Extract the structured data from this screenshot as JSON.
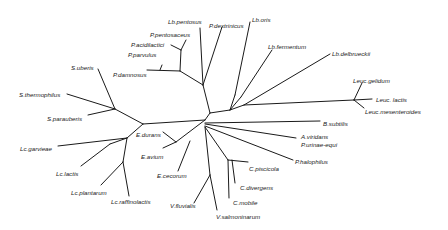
{
  "diagram": {
    "type": "unrooted phylogenetic tree",
    "taxa": [
      {
        "id": "lb_pentosus",
        "label": "Lb.pentosus",
        "x": 168,
        "y": 19
      },
      {
        "id": "p_dextrinicus",
        "label": "P.dextrinicus",
        "x": 209,
        "y": 23
      },
      {
        "id": "lb_oris",
        "label": "Lb.oris",
        "x": 252,
        "y": 17
      },
      {
        "id": "p_pentosaceus",
        "label": "P.pentosaceus",
        "x": 150,
        "y": 32
      },
      {
        "id": "p_acidilactici",
        "label": "P.acidilactici",
        "x": 131,
        "y": 42
      },
      {
        "id": "p_parvulus",
        "label": "P.parvulus",
        "x": 128,
        "y": 52
      },
      {
        "id": "p_damnosus",
        "label": "P.damnosus",
        "x": 113,
        "y": 72
      },
      {
        "id": "lb_fermentum",
        "label": "Lb.fermentum",
        "x": 268,
        "y": 44
      },
      {
        "id": "lb_delbrueckii",
        "label": "Lb.delbrueckii",
        "x": 332,
        "y": 51
      },
      {
        "id": "s_uberis",
        "label": "S.uberis",
        "x": 71,
        "y": 65
      },
      {
        "id": "s_thermophilus",
        "label": "S.thermophilus",
        "x": 19,
        "y": 92
      },
      {
        "id": "s_parauberis",
        "label": "S.parauberis",
        "x": 47,
        "y": 116
      },
      {
        "id": "leuc_gelidum",
        "label": "Leuc.gelidum",
        "x": 353,
        "y": 78
      },
      {
        "id": "leuc_lactis",
        "label": "Leuc. lactis",
        "x": 376,
        "y": 97
      },
      {
        "id": "leuc_mesenteroides",
        "label": "Leuc.mesenteroides",
        "x": 365,
        "y": 109
      },
      {
        "id": "b_subtilis",
        "label": "B.subtilis",
        "x": 323,
        "y": 121
      },
      {
        "id": "a_viridans",
        "label": "A.viridans",
        "x": 301,
        "y": 134
      },
      {
        "id": "p_urinae_equi",
        "label": "P.urinae-equi",
        "x": 301,
        "y": 142
      },
      {
        "id": "p_halophilus",
        "label": "P.halophilus",
        "x": 295,
        "y": 159
      },
      {
        "id": "e_durans",
        "label": "E.durans",
        "x": 136,
        "y": 132
      },
      {
        "id": "e_avium",
        "label": "E.avium",
        "x": 141,
        "y": 154
      },
      {
        "id": "lc_garvieae",
        "label": "Lc.garvieae",
        "x": 20,
        "y": 146
      },
      {
        "id": "c_piscicola",
        "label": "C.piscicola",
        "x": 249,
        "y": 166
      },
      {
        "id": "e_cecorum",
        "label": "E.cecorum",
        "x": 157,
        "y": 173
      },
      {
        "id": "lc_lactis",
        "label": "Lc.lactis",
        "x": 56,
        "y": 171
      },
      {
        "id": "c_divergens",
        "label": "C.divergens",
        "x": 240,
        "y": 185
      },
      {
        "id": "lc_plantarum",
        "label": "Lc.plantarum",
        "x": 71,
        "y": 190
      },
      {
        "id": "c_mobile",
        "label": "C.mobile",
        "x": 233,
        "y": 200
      },
      {
        "id": "lc_raffinolactis",
        "label": "Lc.raffinolactis",
        "x": 111,
        "y": 199
      },
      {
        "id": "v_fluvialis",
        "label": "V.fluvialis",
        "x": 170,
        "y": 203
      },
      {
        "id": "v_salmoninarum",
        "label": "V.salmoninarum",
        "x": 216,
        "y": 214
      }
    ],
    "branches": [
      [
        205,
        120,
        210,
        113
      ],
      [
        210,
        113,
        203,
        85
      ],
      [
        203,
        85,
        180,
        71
      ],
      [
        180,
        71,
        147,
        70
      ],
      [
        162,
        65,
        160,
        70
      ],
      [
        180,
        71,
        181,
        50
      ],
      [
        181,
        50,
        171,
        45
      ],
      [
        181,
        50,
        186,
        40
      ],
      [
        203,
        85,
        200,
        28
      ],
      [
        203,
        85,
        222,
        27
      ],
      [
        210,
        113,
        230,
        110
      ],
      [
        230,
        110,
        235,
        95
      ],
      [
        235,
        95,
        250,
        22
      ],
      [
        230,
        110,
        241,
        97
      ],
      [
        241,
        97,
        272,
        50
      ],
      [
        230,
        110,
        244,
        105
      ],
      [
        244,
        105,
        330,
        54
      ],
      [
        244,
        105,
        354,
        100
      ],
      [
        354,
        100,
        362,
        83
      ],
      [
        354,
        100,
        372,
        99
      ],
      [
        354,
        100,
        364,
        108
      ],
      [
        205,
        120,
        143,
        124
      ],
      [
        143,
        124,
        115,
        109
      ],
      [
        115,
        109,
        98,
        69
      ],
      [
        115,
        109,
        67,
        94
      ],
      [
        115,
        109,
        88,
        115
      ],
      [
        143,
        124,
        127,
        138
      ],
      [
        127,
        138,
        110,
        144
      ],
      [
        127,
        138,
        58,
        146
      ],
      [
        110,
        144,
        81,
        166
      ],
      [
        127,
        138,
        123,
        162
      ],
      [
        123,
        162,
        101,
        185
      ],
      [
        123,
        162,
        129,
        196
      ],
      [
        205,
        120,
        176,
        142
      ],
      [
        176,
        142,
        163,
        132
      ],
      [
        176,
        142,
        163,
        148
      ],
      [
        190,
        141,
        178,
        171
      ],
      [
        205,
        123,
        320,
        121
      ],
      [
        205,
        124,
        296,
        138
      ],
      [
        205,
        126,
        293,
        160
      ],
      [
        205,
        127,
        228,
        160
      ],
      [
        228,
        160,
        248,
        162
      ],
      [
        228,
        160,
        229,
        198
      ],
      [
        232,
        160,
        235,
        183
      ],
      [
        205,
        127,
        210,
        175
      ],
      [
        210,
        175,
        217,
        210
      ],
      [
        210,
        175,
        194,
        203
      ]
    ]
  }
}
